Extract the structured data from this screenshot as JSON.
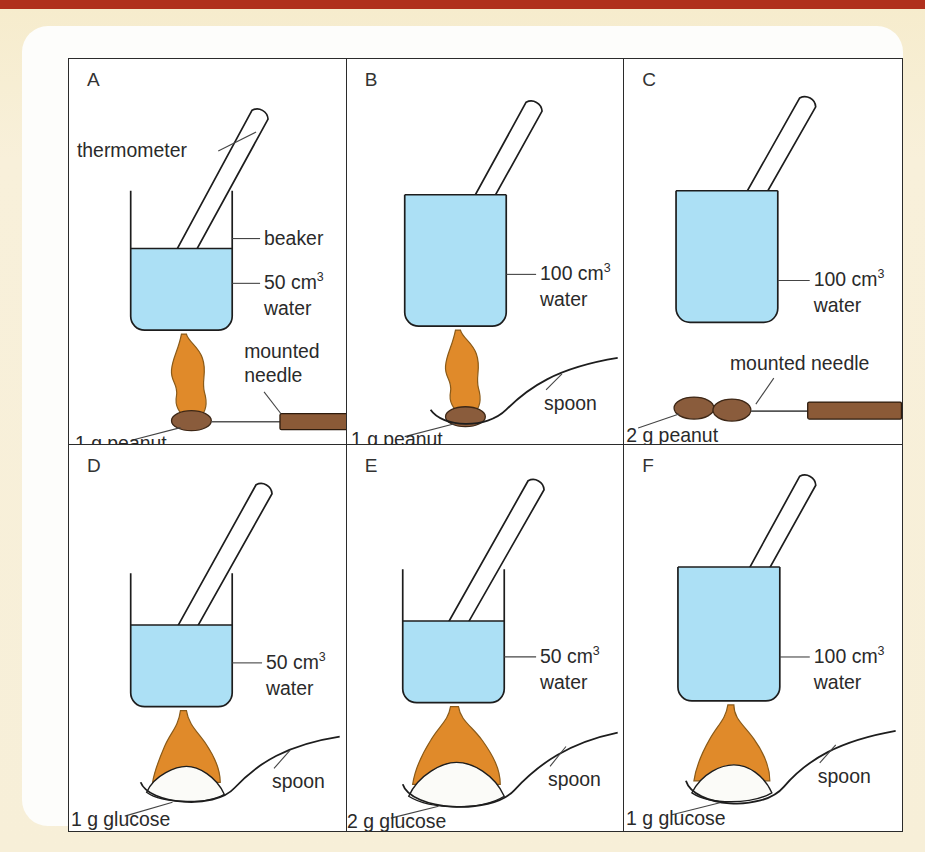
{
  "figure": {
    "colors": {
      "water": "#ace0f5",
      "flame": "#e08a2a",
      "peanut": "#8a5c3c",
      "glucose": "#fbfbf8",
      "needle_handle": "#8b5a37",
      "page_background": "#f7efd8",
      "top_rule": "#b0301c"
    },
    "panels": [
      {
        "letter": "A",
        "volume_value": "50 cm",
        "volume_sup": "3",
        "water_label": "water",
        "fuel_label": "1 g peanut",
        "support_label": "mounted needle",
        "thermometer_label": "thermometer",
        "beaker_label": "beaker",
        "fuel_type": "peanut",
        "fuel_count": 1,
        "support": "mounted needle",
        "lit": true,
        "fill": "half"
      },
      {
        "letter": "B",
        "volume_value": "100 cm",
        "volume_sup": "3",
        "water_label": "water",
        "fuel_label": "1 g peanut",
        "support_label": "spoon",
        "fuel_type": "peanut",
        "fuel_count": 1,
        "support": "spoon",
        "lit": true,
        "fill": "full"
      },
      {
        "letter": "C",
        "volume_value": "100 cm",
        "volume_sup": "3",
        "water_label": "water",
        "fuel_label": "2 g peanut",
        "support_label": "mounted needle",
        "fuel_type": "peanut",
        "fuel_count": 2,
        "support": "mounted needle",
        "lit": false,
        "fill": "full"
      },
      {
        "letter": "D",
        "volume_value": "50 cm",
        "volume_sup": "3",
        "water_label": "water",
        "fuel_label": "1 g glucose",
        "support_label": "spoon",
        "fuel_type": "glucose",
        "fuel_count": 1,
        "support": "spoon",
        "lit": true,
        "fill": "half"
      },
      {
        "letter": "E",
        "volume_value": "50 cm",
        "volume_sup": "3",
        "water_label": "water",
        "fuel_label": "2 g glucose",
        "support_label": "spoon",
        "fuel_type": "glucose",
        "fuel_count": 2,
        "support": "spoon",
        "lit": true,
        "fill": "half"
      },
      {
        "letter": "F",
        "volume_value": "100 cm",
        "volume_sup": "3",
        "water_label": "water",
        "fuel_label": "1 g glucose",
        "support_label": "spoon",
        "fuel_type": "glucose",
        "fuel_count": 1,
        "support": "spoon",
        "lit": true,
        "fill": "full"
      }
    ]
  }
}
